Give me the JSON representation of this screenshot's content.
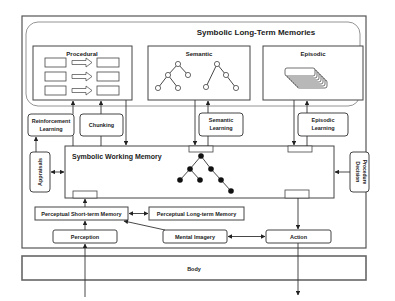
{
  "diagram": {
    "long_term": {
      "title": "Symbolic Long-Term Memories",
      "procedural": "Procedural",
      "semantic": "Semantic",
      "episodic": "Episodic"
    },
    "learning": {
      "reinforcement_line1": "Reinforcement",
      "reinforcement_line2": "Learning",
      "chunking": "Chunking",
      "semantic_line1": "Semantic",
      "semantic_line2": "Learning",
      "episodic_line1": "Episodic",
      "episodic_line2": "Learning"
    },
    "working_memory": "Symbolic Working Memory",
    "appraisals": "Appraisals",
    "decision_line1": "Decision",
    "decision_line2": "Procedure",
    "perceptual_stm": "Perceptual Short-term Memory",
    "perceptual_ltm": "Perceptual Long-term Memory",
    "perception": "Perception",
    "mental_imagery": "Mental Imagery",
    "action": "Action",
    "body": "Body"
  }
}
